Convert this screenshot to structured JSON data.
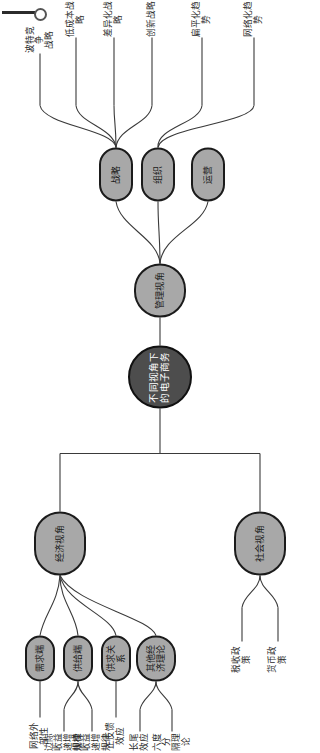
{
  "diagram": {
    "type": "mindmap",
    "orientation": "rotated-90-ccw",
    "colors": {
      "root_fill": "#4d4d4d",
      "node_fill": "#a8a8a8",
      "stroke": "#1b1b1b",
      "leaf_text": "#2a2a2a",
      "background": "#ffffff"
    }
  },
  "root": {
    "label": "不同视角下\n的电子商务"
  },
  "branches": {
    "economic": {
      "label": "经济视角",
      "children": [
        {
          "label": "需求端",
          "leaves": [
            {
              "label": "网络外部性"
            }
          ]
        },
        {
          "label": "供给端",
          "leaves": [
            {
              "label": "边际收益\n递增规律"
            },
            {
              "label": "规模收益\n递增规律"
            }
          ]
        },
        {
          "label": "供求关系",
          "leaves": [
            {
              "label": "正反馈效应"
            }
          ]
        },
        {
          "label": "其他经济理论",
          "leaves": [
            {
              "label": "长尾效应"
            },
            {
              "label": "六度分\n隔理论"
            }
          ]
        }
      ]
    },
    "social": {
      "label": "社会视角",
      "leaves": [
        {
          "label": "税收政策"
        },
        {
          "label": "货币政策"
        }
      ]
    },
    "management": {
      "label": "管理视角",
      "children": [
        {
          "label": "战略",
          "leaves": [
            {
              "label": "波特竞争\n战略"
            },
            {
              "label": "低成本战略"
            },
            {
              "label": "差异化战略"
            },
            {
              "label": "创新战略"
            }
          ]
        },
        {
          "label": "组织",
          "leaves": [
            {
              "label": "扁平化趋势"
            },
            {
              "label": "网络化趋势"
            }
          ]
        },
        {
          "label": "运营",
          "leaves": []
        }
      ]
    }
  },
  "artifact": {
    "name": "scan-edge-marker"
  }
}
